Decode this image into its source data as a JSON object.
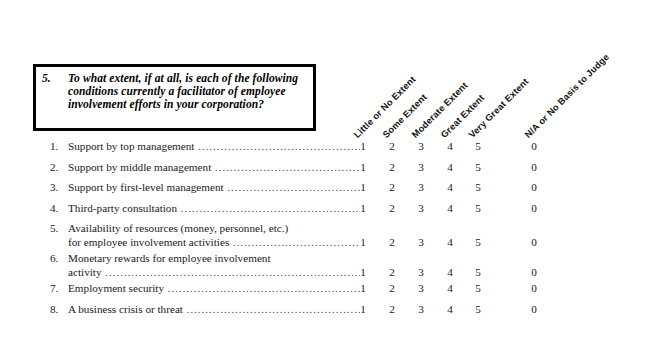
{
  "question": {
    "number": "5.",
    "text": "To what extent, if at all, is each of the following conditions currently a facilitator of employee involvement efforts in your corporation?"
  },
  "columns": [
    {
      "label": "Little or No Extent",
      "value": "1",
      "x": 357
    },
    {
      "label": "Some Extent",
      "value": "2",
      "x": 386
    },
    {
      "label": "Moderate Extent",
      "value": "3",
      "x": 415
    },
    {
      "label": "Great Extent",
      "value": "4",
      "x": 444
    },
    {
      "label": "Very Great Extent",
      "value": "5",
      "x": 472
    },
    {
      "label": "N/A or No Basis to Judge",
      "value": "0",
      "x": 528
    }
  ],
  "items": [
    {
      "number": "1.",
      "label": "Support by top management",
      "line2": "",
      "values": [
        "1",
        "2",
        "3",
        "4",
        "5",
        "0"
      ]
    },
    {
      "number": "2.",
      "label": "Support by middle management",
      "line2": "",
      "values": [
        "1",
        "2",
        "3",
        "4",
        "5",
        "0"
      ]
    },
    {
      "number": "3.",
      "label": "Support by first-level management",
      "line2": "",
      "values": [
        "1",
        "2",
        "3",
        "4",
        "5",
        "0"
      ]
    },
    {
      "number": "4.",
      "label": "Third-party consultation",
      "line2": "",
      "values": [
        "1",
        "2",
        "3",
        "4",
        "5",
        "0"
      ]
    },
    {
      "number": "5.",
      "label": "Availability of resources (money, personnel, etc.)",
      "line2": "for employee involvement activities",
      "values": [
        "1",
        "2",
        "3",
        "4",
        "5",
        "0"
      ]
    },
    {
      "number": "6.",
      "label": "Monetary rewards for employee involvement",
      "line2": "activity",
      "values": [
        "1",
        "2",
        "3",
        "4",
        "5",
        "0"
      ]
    },
    {
      "number": "7.",
      "label": "Employment security",
      "line2": "",
      "values": [
        "1",
        "2",
        "3",
        "4",
        "5",
        "0"
      ]
    },
    {
      "number": "8.",
      "label": "A business crisis or threat",
      "line2": "",
      "values": [
        "1",
        "2",
        "3",
        "4",
        "5",
        "0"
      ]
    }
  ],
  "style": {
    "page_background": "#ffffff",
    "text_color": "#1a1a1a",
    "box_border_color": "#000000"
  }
}
